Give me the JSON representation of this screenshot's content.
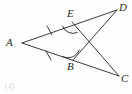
{
  "figure": {
    "caption": "(4)",
    "stroke_color": "#3a3a3a",
    "label_color": "#2b2b2b",
    "background_color": "#fefefe",
    "labels": {
      "A": "A",
      "B": "B",
      "C": "C",
      "D": "D",
      "E": "E"
    },
    "points": {
      "A": {
        "x": 22,
        "y": 43
      },
      "E": {
        "x": 72,
        "y": 22
      },
      "D": {
        "x": 117,
        "y": 10
      },
      "B": {
        "x": 73,
        "y": 60
      },
      "C": {
        "x": 119,
        "y": 76
      },
      "X": {
        "x": 95,
        "y": 43
      }
    },
    "segments": [
      {
        "name": "A-D",
        "from": "A",
        "to": "D",
        "through": "E"
      },
      {
        "name": "A-C",
        "from": "A",
        "to": "C",
        "through": "B"
      },
      {
        "name": "E-C",
        "from": "E",
        "to": "C"
      },
      {
        "name": "B-D",
        "from": "B",
        "to": "D"
      }
    ],
    "tick_marks": [
      {
        "name": "tick-AE",
        "on_segment": "A-E",
        "count": 1
      },
      {
        "name": "tick-AB",
        "on_segment": "A-B",
        "count": 1
      }
    ],
    "angle_arcs": [
      {
        "name": "angle-AEC",
        "vertex": "E",
        "rays": [
          "E-A",
          "E-C"
        ]
      },
      {
        "name": "angle-ABD",
        "vertex": "B",
        "rays": [
          "B-A",
          "B-D"
        ]
      }
    ]
  }
}
